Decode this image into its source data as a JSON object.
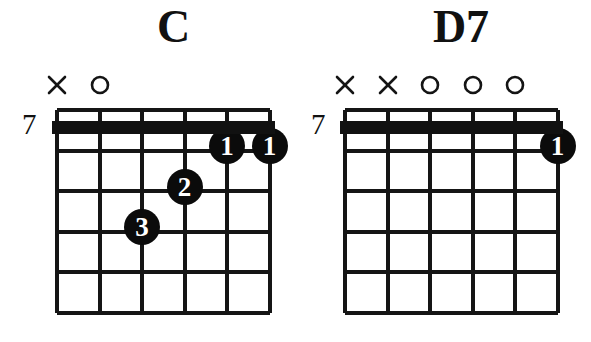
{
  "page": {
    "background_color": "#ffffff",
    "ink_color": "#111111",
    "width": 591,
    "height": 342,
    "content_type": "guitar-chord-diagrams"
  },
  "diagrams": [
    {
      "id": "chord-c",
      "title": "C",
      "position_label": "7",
      "string_count": 6,
      "fret_count": 5,
      "has_barre_nut": true,
      "string_markers": [
        {
          "string": 1,
          "symbol": "X",
          "name": "muted-string-marker"
        },
        {
          "string": 2,
          "symbol": "O",
          "name": "open-string-marker"
        },
        {
          "string": 3,
          "symbol": "",
          "name": "none"
        },
        {
          "string": 4,
          "symbol": "",
          "name": "none"
        },
        {
          "string": 5,
          "symbol": "",
          "name": "none"
        },
        {
          "string": 6,
          "symbol": "",
          "name": "none"
        }
      ],
      "finger_dots": [
        {
          "finger": "1",
          "string": 5,
          "fret": 1
        },
        {
          "finger": "1",
          "string": 6,
          "fret": 1
        },
        {
          "finger": "2",
          "string": 4,
          "fret": 2
        },
        {
          "finger": "3",
          "string": 3,
          "fret": 3
        }
      ]
    },
    {
      "id": "chord-d7",
      "title": "D7",
      "position_label": "7",
      "string_count": 6,
      "fret_count": 5,
      "has_barre_nut": true,
      "string_markers": [
        {
          "string": 1,
          "symbol": "X",
          "name": "muted-string-marker"
        },
        {
          "string": 2,
          "symbol": "X",
          "name": "muted-string-marker"
        },
        {
          "string": 3,
          "symbol": "O",
          "name": "open-string-marker"
        },
        {
          "string": 4,
          "symbol": "O",
          "name": "open-string-marker"
        },
        {
          "string": 5,
          "symbol": "O",
          "name": "open-string-marker"
        },
        {
          "string": 6,
          "symbol": "",
          "name": "none"
        }
      ],
      "finger_dots": [
        {
          "finger": "1",
          "string": 6,
          "fret": 1
        }
      ]
    }
  ]
}
